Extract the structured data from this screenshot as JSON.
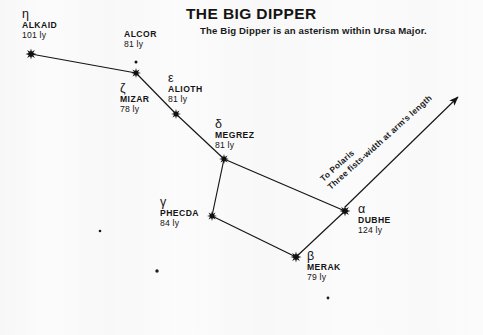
{
  "title": {
    "main": "THE BIG DIPPER",
    "subtitle": "The Big Dipper is an asterism within Ursa Major."
  },
  "annotation": {
    "line1": "To Polaris",
    "line2": "Three fists-width at arm's length"
  },
  "chart_data": {
    "type": "scatter",
    "title": "THE BIG DIPPER",
    "subtitle": "The Big Dipper is an asterism within Ursa Major.",
    "xlabel": "",
    "ylabel": "",
    "grid": false,
    "legend": null,
    "annotations": [
      {
        "name": "polaris-arrow",
        "text": "To Polaris / Three fists-width at arm's length",
        "from": [
          345,
          207
        ],
        "to": [
          458,
          97
        ],
        "arrow": true
      }
    ],
    "stars": [
      {
        "id": "alkaid",
        "greek": "η",
        "proper": "ALKAID",
        "distance": "101 ly",
        "distance_ly": 101,
        "x": 31,
        "y": 54,
        "marker": "burst",
        "size": 11,
        "label_x": 22,
        "label_y": 8
      },
      {
        "id": "alcor",
        "greek": "",
        "proper": "ALCOR",
        "distance": "81 ly",
        "distance_ly": 81,
        "x": 136,
        "y": 62,
        "marker": "dot",
        "size": 3,
        "label_x": 124,
        "label_y": 30
      },
      {
        "id": "mizar",
        "greek": "ζ",
        "proper": "MIZAR",
        "distance": "78 ly",
        "distance_ly": 78,
        "x": 136,
        "y": 73,
        "marker": "burst",
        "size": 10,
        "label_x": 120,
        "label_y": 82
      },
      {
        "id": "alioth",
        "greek": "ε",
        "proper": "ALIOTH",
        "distance": "81 ly",
        "distance_ly": 81,
        "x": 176,
        "y": 114,
        "marker": "burst",
        "size": 10,
        "label_x": 168,
        "label_y": 72
      },
      {
        "id": "megrez",
        "greek": "δ",
        "proper": "MEGREZ",
        "distance": "81 ly",
        "distance_ly": 81,
        "x": 224,
        "y": 159,
        "marker": "burst",
        "size": 10,
        "label_x": 215,
        "label_y": 118
      },
      {
        "id": "dubhe",
        "greek": "α",
        "proper": "DUBHE",
        "distance": "124 ly",
        "distance_ly": 124,
        "x": 345,
        "y": 211,
        "marker": "burst",
        "size": 11,
        "label_x": 358,
        "label_y": 203
      },
      {
        "id": "merak",
        "greek": "β",
        "proper": "MERAK",
        "distance": "79 ly",
        "distance_ly": 79,
        "x": 296,
        "y": 257,
        "marker": "burst",
        "size": 11,
        "label_x": 307,
        "label_y": 250
      },
      {
        "id": "phecda",
        "greek": "γ",
        "proper": "PHECDA",
        "distance": "84 ly",
        "distance_ly": 84,
        "x": 212,
        "y": 216,
        "marker": "burst",
        "size": 10,
        "label_x": 160,
        "label_y": 196
      }
    ],
    "field_stars": [
      {
        "x": 100,
        "y": 231,
        "size": 2.6
      },
      {
        "x": 157,
        "y": 271,
        "size": 3.4
      },
      {
        "x": 328,
        "y": 298,
        "size": 2.8
      }
    ],
    "constellation_lines": [
      {
        "from": "alkaid",
        "to": "mizar"
      },
      {
        "from": "mizar",
        "to": "alioth"
      },
      {
        "from": "alioth",
        "to": "megrez"
      },
      {
        "from": "megrez",
        "to": "dubhe"
      },
      {
        "from": "dubhe",
        "to": "merak"
      },
      {
        "from": "merak",
        "to": "phecda"
      },
      {
        "from": "phecda",
        "to": "megrez"
      }
    ]
  }
}
